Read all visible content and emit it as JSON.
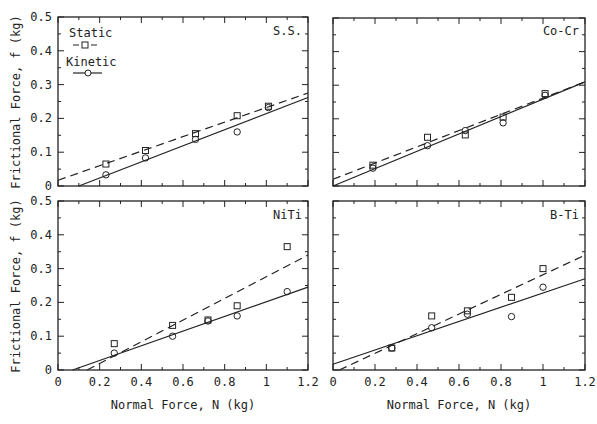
{
  "chart_data": [
    {
      "type": "scatter",
      "title": "S.S.",
      "xlabel": "",
      "ylabel": "Frictional Force,  f (kg)",
      "xlim": [
        0,
        1.2
      ],
      "ylim": [
        0,
        0.5
      ],
      "grid": false,
      "legend": {
        "position": "upper-left",
        "entries": [
          "Static",
          "Kinetic"
        ]
      },
      "series": [
        {
          "name": "Static",
          "marker": "square",
          "line": "dashed",
          "x": [
            0.23,
            0.42,
            0.66,
            0.86,
            1.01
          ],
          "y": [
            0.065,
            0.105,
            0.155,
            0.208,
            0.236
          ],
          "fit": {
            "x": [
              0,
              1.2
            ],
            "y": [
              0.017,
              0.275
            ]
          }
        },
        {
          "name": "Kinetic",
          "marker": "circle",
          "line": "solid",
          "x": [
            0.23,
            0.42,
            0.66,
            0.86,
            1.01
          ],
          "y": [
            0.033,
            0.083,
            0.138,
            0.16,
            0.232
          ],
          "fit": {
            "x": [
              0.1,
              1.2
            ],
            "y": [
              0,
              0.262
            ]
          }
        }
      ]
    },
    {
      "type": "scatter",
      "title": "Co-Cr",
      "xlabel": "",
      "ylabel": "",
      "xlim": [
        0,
        1.2
      ],
      "ylim": [
        0,
        0.5
      ],
      "grid": false,
      "series": [
        {
          "name": "Static",
          "marker": "square",
          "line": "dashed",
          "x": [
            0.19,
            0.45,
            0.63,
            0.81,
            1.01
          ],
          "y": [
            0.062,
            0.145,
            0.152,
            0.205,
            0.275
          ],
          "fit": {
            "x": [
              0,
              1.2
            ],
            "y": [
              0.02,
              0.31
            ]
          }
        },
        {
          "name": "Kinetic",
          "marker": "circle",
          "line": "solid",
          "x": [
            0.19,
            0.45,
            0.63,
            0.81,
            1.01
          ],
          "y": [
            0.053,
            0.12,
            0.165,
            0.188,
            0.27
          ],
          "fit": {
            "x": [
              0,
              1.2
            ],
            "y": [
              0,
              0.31
            ]
          }
        }
      ]
    },
    {
      "type": "scatter",
      "title": "NiTi",
      "xlabel": "Normal Force,  N (kg)",
      "ylabel": "Frictional Force,  f (kg)",
      "xlim": [
        0,
        1.2
      ],
      "ylim": [
        0,
        0.5
      ],
      "grid": false,
      "series": [
        {
          "name": "Static",
          "marker": "square",
          "line": "dashed",
          "x": [
            0.27,
            0.55,
            0.72,
            0.86,
            1.1
          ],
          "y": [
            0.078,
            0.132,
            0.148,
            0.19,
            0.365
          ],
          "fit": {
            "x": [
              0.14,
              1.2
            ],
            "y": [
              0,
              0.34
            ]
          }
        },
        {
          "name": "Kinetic",
          "marker": "circle",
          "line": "solid",
          "x": [
            0.27,
            0.55,
            0.72,
            0.86,
            1.1
          ],
          "y": [
            0.05,
            0.1,
            0.145,
            0.16,
            0.232
          ],
          "fit": {
            "x": [
              0.07,
              1.2
            ],
            "y": [
              0,
              0.245
            ]
          }
        }
      ]
    },
    {
      "type": "scatter",
      "title": "B-Ti",
      "xlabel": "Normal Force,  N (kg)",
      "ylabel": "",
      "xlim": [
        0,
        1.2
      ],
      "ylim": [
        0,
        0.5
      ],
      "grid": false,
      "series": [
        {
          "name": "Static",
          "marker": "square",
          "line": "dashed",
          "x": [
            0.28,
            0.47,
            0.64,
            0.85,
            1.0
          ],
          "y": [
            0.065,
            0.16,
            0.175,
            0.215,
            0.3
          ],
          "fit": {
            "x": [
              0.03,
              1.2
            ],
            "y": [
              0,
              0.34
            ]
          }
        },
        {
          "name": "Kinetic",
          "marker": "circle",
          "line": "solid",
          "x": [
            0.28,
            0.47,
            0.64,
            0.85,
            1.0
          ],
          "y": [
            0.065,
            0.125,
            0.165,
            0.158,
            0.245
          ],
          "fit": {
            "x": [
              0,
              1.2
            ],
            "y": [
              0.017,
              0.27
            ]
          }
        }
      ]
    }
  ],
  "axes": {
    "x_ticks": [
      "0",
      "0.2",
      "0.4",
      "0.6",
      "0.8",
      "1",
      "1.2"
    ],
    "y_ticks": [
      "0",
      "0.1",
      "0.2",
      "0.3",
      "0.4",
      "0.5"
    ]
  },
  "legend": {
    "static_label": "Static",
    "kinetic_label": "Kinetic"
  },
  "labels": {
    "ylabel": "Frictional Force,  f (kg)",
    "xlabel": "Normal Force,  N (kg)"
  },
  "panels": {
    "top_left": "S.S.",
    "top_right": "Co-Cr",
    "bottom_left": "NiTi",
    "bottom_right": "B-Ti"
  }
}
